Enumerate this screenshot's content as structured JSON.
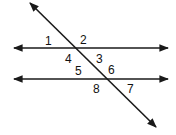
{
  "diagram": {
    "type": "parallel-lines-transversal",
    "angle_labels": [
      "1",
      "2",
      "3",
      "4",
      "5",
      "6",
      "7",
      "8"
    ],
    "colors": {
      "line": "#1a1a1a",
      "background": "#ffffff"
    }
  }
}
